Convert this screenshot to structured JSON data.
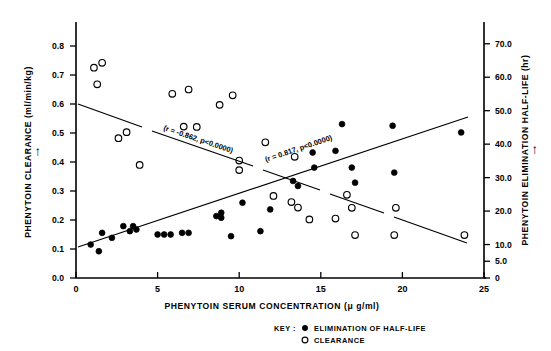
{
  "chart_data": {
    "type": "scatter",
    "title": "",
    "xlabel": "PHENYTOIN SERUM CONCENTRATION (μ g/ml)",
    "ylabel_left": "PHENYTOIN CLEARANCE (ml/min/kg)",
    "ylabel_right": "PHENYTOIN ELIMINATION HALF-LIFE (hr)",
    "xlim": [
      0,
      25
    ],
    "ylim_left": [
      0.0,
      0.9
    ],
    "ylim_right": [
      0,
      78
    ],
    "grid": false,
    "xticks": [
      0,
      5,
      10,
      15,
      20,
      25
    ],
    "xticklabels": [
      "0",
      "5",
      "10",
      "15",
      "20",
      "25"
    ],
    "yticks_left": [
      0.0,
      0.1,
      0.2,
      0.3,
      0.4,
      0.5,
      0.6,
      0.7,
      0.8
    ],
    "yticklabels_left": [
      "0.0",
      "0.1",
      "0.2",
      "0.3",
      "0.4",
      "0.5",
      "0.6",
      "0.7",
      "0.8"
    ],
    "yticks_right": [
      0,
      5,
      10,
      20,
      30,
      40,
      50,
      60,
      70
    ],
    "yticklabels_right": [
      "0",
      "5.0",
      "10.0",
      "20.0",
      "30.0",
      "40.0",
      "50.0",
      "60.0",
      "70.0"
    ],
    "legend_position": "below-right",
    "legend_title": "KEY :",
    "series": [
      {
        "name": "ELIMINATION OF HALF-LIFE",
        "marker": "filled-circle",
        "axis": "right",
        "annotation": "(r = 0.817, p<0.0000)",
        "r": 0.817,
        "p": "<0.0000",
        "points": [
          [
            0.9,
            10.0
          ],
          [
            1.4,
            8.0
          ],
          [
            1.6,
            13.5
          ],
          [
            2.2,
            12.0
          ],
          [
            2.9,
            15.5
          ],
          [
            3.3,
            14.0
          ],
          [
            3.5,
            15.5
          ],
          [
            3.7,
            14.5
          ],
          [
            5.0,
            13.0
          ],
          [
            5.4,
            13.0
          ],
          [
            5.8,
            13.0
          ],
          [
            6.5,
            13.5
          ],
          [
            6.9,
            13.5
          ],
          [
            8.6,
            18.5
          ],
          [
            8.9,
            19.5
          ],
          [
            8.9,
            18.0
          ],
          [
            9.5,
            12.5
          ],
          [
            10.2,
            22.5
          ],
          [
            11.3,
            14.0
          ],
          [
            11.9,
            20.5
          ],
          [
            13.3,
            29.0
          ],
          [
            13.6,
            27.5
          ],
          [
            14.5,
            37.5
          ],
          [
            14.6,
            33.0
          ],
          [
            15.9,
            38.0
          ],
          [
            16.3,
            46.0
          ],
          [
            16.9,
            33.0
          ],
          [
            17.1,
            28.5
          ],
          [
            19.4,
            45.5
          ],
          [
            19.5,
            31.5
          ],
          [
            23.6,
            43.5
          ]
        ]
      },
      {
        "name": "CLEARANCE",
        "marker": "open-circle",
        "axis": "left",
        "annotation": "(r = -0.862, p<0.0000)",
        "r": -0.862,
        "p": "<0.0000",
        "points": [
          [
            1.1,
            0.725
          ],
          [
            1.6,
            0.742
          ],
          [
            1.3,
            0.668
          ],
          [
            2.6,
            0.482
          ],
          [
            3.1,
            0.503
          ],
          [
            3.9,
            0.39
          ],
          [
            5.9,
            0.635
          ],
          [
            6.9,
            0.65
          ],
          [
            6.6,
            0.522
          ],
          [
            7.4,
            0.521
          ],
          [
            8.8,
            0.597
          ],
          [
            9.6,
            0.63
          ],
          [
            10.0,
            0.405
          ],
          [
            10.0,
            0.372
          ],
          [
            11.6,
            0.468
          ],
          [
            12.1,
            0.283
          ],
          [
            13.2,
            0.262
          ],
          [
            13.4,
            0.418
          ],
          [
            13.6,
            0.243
          ],
          [
            14.3,
            0.202
          ],
          [
            15.9,
            0.205
          ],
          [
            16.6,
            0.287
          ],
          [
            16.9,
            0.242
          ],
          [
            17.1,
            0.148
          ],
          [
            19.5,
            0.148
          ],
          [
            19.6,
            0.242
          ],
          [
            23.8,
            0.148
          ]
        ]
      }
    ]
  },
  "annotations": {
    "clearance_fit": "(r = -0.862, p<0.0000)",
    "halflife_fit": "(r = 0.817, p<0.0000)"
  },
  "legend": {
    "key_label": "KEY :",
    "items": [
      {
        "marker": "filled-circle",
        "label": "ELIMINATION OF HALF-LIFE"
      },
      {
        "marker": "open-circle",
        "label": "CLEARANCE"
      }
    ]
  },
  "axes": {
    "x_label": "PHENYTOIN SERUM CONCENTRATION (μ g/ml)",
    "y_left_label": "PHENYTOIN CLEARANCE (ml/min/kg)",
    "y_right_label": "PHENYTOIN ELIMINATION HALF-LIFE (hr)",
    "arrow_glyph": "→"
  }
}
